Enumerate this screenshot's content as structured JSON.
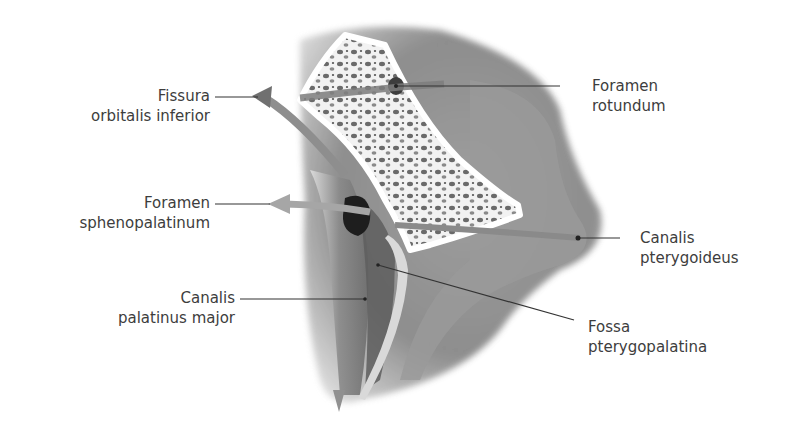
{
  "figure": {
    "labels": {
      "fissura_orbitalis_inferior": [
        "Fissura",
        "orbitalis inferior"
      ],
      "foramen_sphenopalatinum": [
        "Foramen",
        "sphenopalatinum"
      ],
      "canalis_palatinus_major": [
        "Canalis",
        "palatinus major"
      ],
      "foramen_rotundum": [
        "Foramen",
        "rotundum"
      ],
      "canalis_pterygoideus": [
        "Canalis",
        "pterygoideus"
      ],
      "fossa_pterygopalatina": [
        "Fossa",
        "pterygopalatina"
      ]
    }
  },
  "colors": {
    "background": "#ffffff",
    "text": "#3d3d3d",
    "leader_line": "#333333",
    "bone_gray": "#8a8a8a",
    "bone_dark": "#5c5c5c",
    "cancellous_white": "#f4f4f4",
    "arrow_gray": "#a0a0a0"
  }
}
